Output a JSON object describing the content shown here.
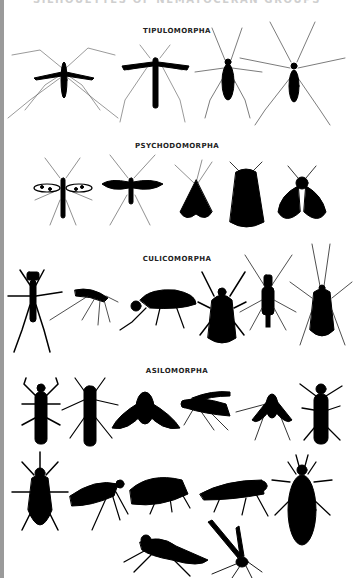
{
  "page": {
    "title": "SILHOUETTES OF NEMATOCERAN GROUPS",
    "background": "#ffffff",
    "left_bar_color": "#9a9a9a",
    "silhouette_color": "#000000"
  },
  "sections": [
    {
      "label": "TIPULOMORPHA",
      "silhouettes": [
        "crane-fly-wings-spread",
        "crane-fly-wings-folded",
        "winter-crane-fly",
        "wingless-crane-fly"
      ]
    },
    {
      "label": "PSYCHODOMORPHA",
      "silhouettes": [
        "spotted-wing-gnat",
        "dark-wing-gnat",
        "moth-fly-tent",
        "moth-fly-broad",
        "moth-fly-round"
      ]
    },
    {
      "label": "CULICOMORPHA",
      "silhouettes": [
        "water-midge",
        "mosquito-side",
        "black-fly-side",
        "black-fly-top",
        "biting-midge",
        "long-antenna-midge"
      ]
    },
    {
      "label": "ASILOMORPHA",
      "silhouettes": [
        "robber-fly-top",
        "slender-fly-top",
        "bee-fly",
        "soldier-fly-side",
        "small-bee-fly",
        "stiletto-fly",
        "horse-fly-top",
        "snipe-fly-side",
        "flower-fly-side",
        "long-legged-fly-side",
        "soldier-fly-top",
        "robber-fly-side",
        "dance-fly-side"
      ]
    }
  ]
}
